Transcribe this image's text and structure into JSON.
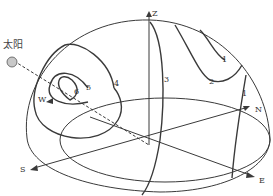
{
  "diagram": {
    "sun_label": "太阳",
    "axes": {
      "z": "Z",
      "n": "N",
      "e": "E",
      "s": "S",
      "w": "W"
    },
    "contour_labels": [
      "1",
      "2",
      "3",
      "4",
      "5",
      "6",
      "1"
    ],
    "colors": {
      "line": "#3a3a3a",
      "sun_fill": "#c8c8c8",
      "background": "#ffffff"
    }
  }
}
